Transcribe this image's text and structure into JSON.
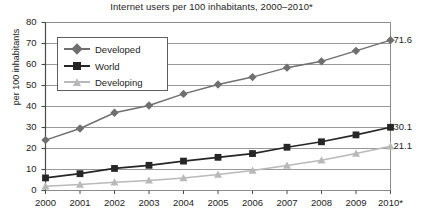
{
  "chart_data": {
    "type": "line",
    "title": "Internet users per 100 inhabitants, 2000–2010*",
    "xlabel": "",
    "ylabel": "per 100 inhabitants",
    "categories": [
      "2000",
      "2001",
      "2002",
      "2003",
      "2004",
      "2005",
      "2006",
      "2007",
      "2008",
      "2009",
      "2010*"
    ],
    "ylim": [
      0,
      80
    ],
    "yticks": [
      0,
      10,
      20,
      30,
      40,
      50,
      60,
      70,
      80
    ],
    "grid": true,
    "legend_position": "upper-left-inside",
    "series": [
      {
        "name": "Developed",
        "color": "#6f6f6f",
        "marker": "diamond",
        "values": [
          24.0,
          29.5,
          37.0,
          40.5,
          46.0,
          50.5,
          54.0,
          58.5,
          61.5,
          66.5,
          71.6
        ],
        "end_label": "71.6"
      },
      {
        "name": "World",
        "color": "#262626",
        "marker": "square",
        "values": [
          6.0,
          8.0,
          10.5,
          12.0,
          14.0,
          15.8,
          17.6,
          20.6,
          23.2,
          26.5,
          30.1
        ],
        "end_label": "30.1"
      },
      {
        "name": "Developing",
        "color": "#b9b9b9",
        "marker": "triangle",
        "values": [
          2.0,
          2.8,
          3.9,
          4.8,
          5.9,
          7.6,
          9.5,
          11.9,
          14.4,
          17.6,
          21.1
        ],
        "end_label": "21.1"
      }
    ]
  },
  "legend": {
    "items": [
      {
        "label": "Developed"
      },
      {
        "label": "World"
      },
      {
        "label": "Developing"
      }
    ]
  },
  "colors": {
    "developed": "#6f6f6f",
    "world": "#262626",
    "developing": "#b9b9b9",
    "grid": "#8c8c8c",
    "axis": "#4a4a4a",
    "text": "#1d1d1d",
    "background": "#ffffff"
  }
}
